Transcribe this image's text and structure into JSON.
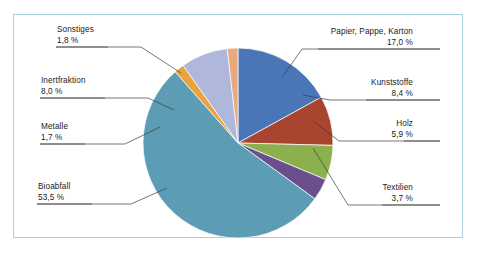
{
  "figure": {
    "border_color": "#aacfdd",
    "background": "#ffffff"
  },
  "chart_data": {
    "type": "pie",
    "title": "",
    "xlabel": "",
    "ylabel": "",
    "unit": "%",
    "legend": "none",
    "labels_position": "outside-with-leader-lines",
    "start_angle_deg": -90,
    "direction": "clockwise",
    "categories": [
      "Papier, Pappe, Karton",
      "Kunststoffe",
      "Holz",
      "Textilien",
      "Bioabfall",
      "Metalle",
      "Inertfraktion",
      "Sonstiges"
    ],
    "values": [
      17.0,
      8.4,
      5.9,
      3.7,
      53.5,
      1.7,
      8.0,
      1.8
    ],
    "value_labels": [
      "17,0 %",
      "8,4 %",
      "5,9 %",
      "3,7 %",
      "53,5 %",
      "1,7 %",
      "8,0 %",
      "1,8 %"
    ],
    "colors": [
      "#4a76b8",
      "#a8442f",
      "#8cb04e",
      "#6b4e8c",
      "#5d9cb5",
      "#e8a33d",
      "#afb8dc",
      "#e8a97e"
    ],
    "total": 100.0
  },
  "labels": {
    "papier": {
      "name": "Papier, Pappe, Karton",
      "pct": "17,0 %"
    },
    "kunststoffe": {
      "name": "Kunststoffe",
      "pct": "8,4 %"
    },
    "holz": {
      "name": "Holz",
      "pct": "5,9 %"
    },
    "textilien": {
      "name": "Textilien",
      "pct": "3,7 %"
    },
    "bioabfall": {
      "name": "Bioabfall",
      "pct": "53,5 %"
    },
    "metalle": {
      "name": "Metalle",
      "pct": "1,7 %"
    },
    "inertfraktion": {
      "name": "Inertfraktion",
      "pct": "8,0 %"
    },
    "sonstiges": {
      "name": "Sonstiges",
      "pct": "1,8 %"
    }
  }
}
